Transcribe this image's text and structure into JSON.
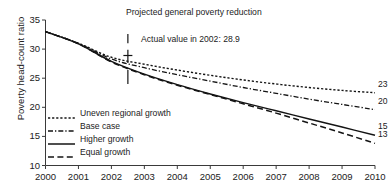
{
  "chart_data": {
    "type": "line",
    "title": "Projected general poverty reduction",
    "xlabel": "",
    "ylabel": "Poverty head-count ratio",
    "xlim": [
      2000,
      2010
    ],
    "ylim": [
      10,
      35
    ],
    "grid": false,
    "legend_position": "inside-lower-left",
    "xticks": [
      "2000",
      "2001",
      "2002",
      "2003",
      "2004",
      "2005",
      "2006",
      "2007",
      "2008",
      "2009",
      "2010"
    ],
    "yticks": [
      "10",
      "15",
      "20",
      "25",
      "30",
      "35"
    ],
    "x": [
      2000,
      2001,
      2002,
      2003,
      2004,
      2005,
      2006,
      2007,
      2008,
      2009,
      2010
    ],
    "series": [
      {
        "name": "Uneven regional growth",
        "style": "dotted",
        "values": [
          33.0,
          31.0,
          28.6,
          27.4,
          26.4,
          25.5,
          24.7,
          24.0,
          23.4,
          22.9,
          22.5
        ],
        "end_label": "23"
      },
      {
        "name": "Base case",
        "style": "dash-dot",
        "values": [
          33.0,
          31.0,
          28.3,
          26.8,
          25.6,
          24.5,
          23.4,
          22.4,
          21.4,
          20.5,
          19.6
        ],
        "end_label": "20"
      },
      {
        "name": "Higher growth",
        "style": "solid",
        "values": [
          33.0,
          30.9,
          27.9,
          25.7,
          23.9,
          22.3,
          20.8,
          19.4,
          18.0,
          16.6,
          15.2
        ],
        "end_label": "15"
      },
      {
        "name": "Equal growth",
        "style": "dashed",
        "values": [
          33.0,
          30.9,
          27.8,
          25.6,
          23.8,
          22.2,
          20.6,
          19.0,
          17.3,
          15.6,
          13.8
        ],
        "end_label": "13"
      }
    ],
    "annotations": [
      {
        "name": "actual-value-note",
        "text": "Actual value in 2002: 28.9",
        "x": 2002.5,
        "y": 28.9
      }
    ],
    "marker": {
      "name": "actual-value-marker",
      "x": 2002.5,
      "y": 28.9,
      "label": "28.9"
    },
    "colors": {
      "line": "#141414",
      "axis": "#3a3a3a",
      "text": "#222222",
      "background": "#ffffff"
    }
  }
}
